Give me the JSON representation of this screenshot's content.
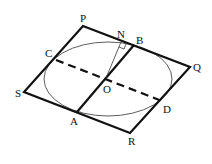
{
  "diagram": {
    "type": "geometry",
    "points": {
      "P": {
        "label": "P",
        "x": 83,
        "y": 26
      },
      "Q": {
        "label": "Q",
        "x": 190,
        "y": 67
      },
      "R": {
        "label": "R",
        "x": 130,
        "y": 133
      },
      "S": {
        "label": "S",
        "x": 24,
        "y": 92
      },
      "A": {
        "label": "A",
        "x": 77,
        "y": 112
      },
      "B": {
        "label": "B",
        "x": 134,
        "y": 45
      },
      "C": {
        "label": "C",
        "x": 56,
        "y": 60
      },
      "D": {
        "label": "D",
        "x": 162,
        "y": 101
      },
      "O": {
        "label": "O",
        "x": 106,
        "y": 78
      },
      "N": {
        "label": "N",
        "x": 121,
        "y": 42
      }
    },
    "segments": [
      {
        "from": "P",
        "to": "Q",
        "style": "solid-thick"
      },
      {
        "from": "Q",
        "to": "R",
        "style": "solid-thick"
      },
      {
        "from": "R",
        "to": "S",
        "style": "solid-thick"
      },
      {
        "from": "S",
        "to": "P",
        "style": "solid-thick"
      },
      {
        "from": "A",
        "to": "B",
        "style": "solid-thick"
      },
      {
        "from": "C",
        "to": "D",
        "style": "dashed-thick"
      },
      {
        "from": "O",
        "to": "N",
        "style": "solid-thin"
      }
    ],
    "ellipse": {
      "cx": 108,
      "cy": 79,
      "rx": 64,
      "ry": 37,
      "style": "solid-thin"
    },
    "right_angle_marker": {
      "at": "N"
    },
    "colors": {
      "stroke": "#111111",
      "background": "#ffffff"
    }
  }
}
